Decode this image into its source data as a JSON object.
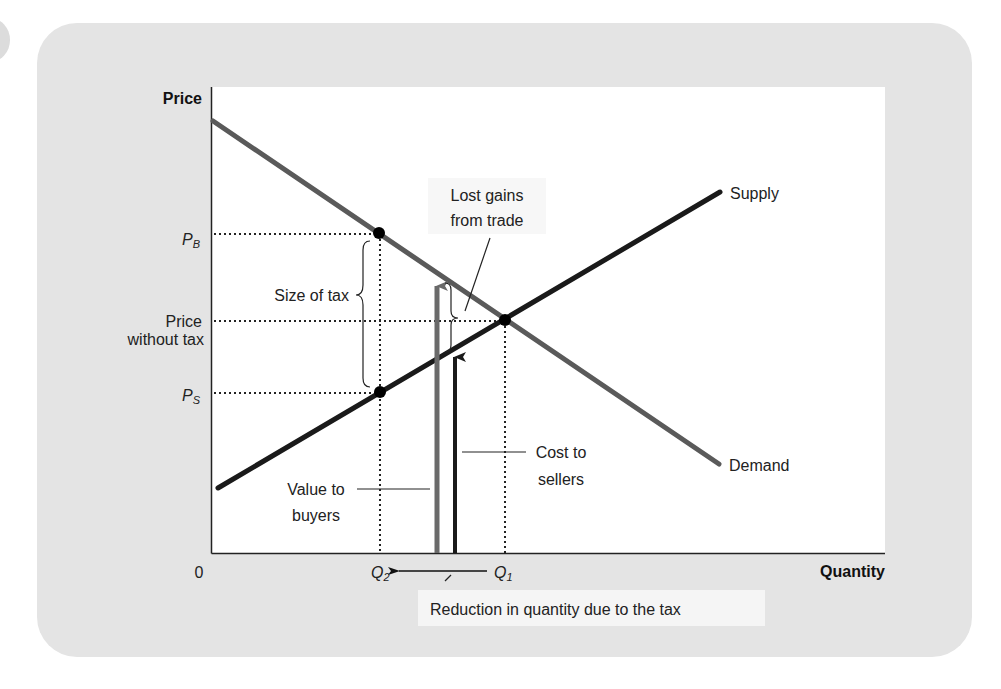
{
  "chart_data": {
    "type": "line",
    "title": "",
    "xlabel": "Quantity",
    "ylabel": "Price",
    "origin_label": "0",
    "grid": false,
    "legend": "none (inline curve labels)",
    "colors": {
      "panel": "#e4e4e4",
      "plot_bg": "#ffffff",
      "demand": "#5a5a5a",
      "supply": "#1a1a1a",
      "value_arrow": "#6a6a6a",
      "cost_arrow": "#1a1a1a"
    },
    "series": [
      {
        "name": "Demand",
        "label": "Demand",
        "points": [
          [
            213,
            121
          ],
          [
            719,
            464
          ]
        ]
      },
      {
        "name": "Supply",
        "label": "Supply",
        "points": [
          [
            218,
            488
          ],
          [
            720,
            192
          ]
        ]
      }
    ],
    "y_ticks": [
      {
        "label": "P",
        "sub": "B",
        "y": 233
      },
      {
        "label_lines": [
          "Price",
          "without tax"
        ],
        "y": 320
      },
      {
        "label": "P",
        "sub": "S",
        "y": 392
      }
    ],
    "x_ticks": [
      {
        "label": "Q",
        "sub": "2",
        "x": 380
      },
      {
        "label": "Q",
        "sub": "1",
        "x": 505
      }
    ],
    "points": [
      {
        "name": "buyer-price-point",
        "x": 379,
        "y": 233
      },
      {
        "name": "seller-price-point",
        "x": 380,
        "y": 392
      },
      {
        "name": "equilibrium-point",
        "x": 505,
        "y": 320
      }
    ],
    "annotations": {
      "size_of_tax": "Size of tax",
      "lost_gains_line1": "Lost gains",
      "lost_gains_line2": "from trade",
      "value_to_buyers_line1": "Value to",
      "value_to_buyers_line2": "buyers",
      "cost_to_sellers_line1": "Cost to",
      "cost_to_sellers_line2": "sellers",
      "reduction": "Reduction in quantity due to the tax"
    }
  }
}
